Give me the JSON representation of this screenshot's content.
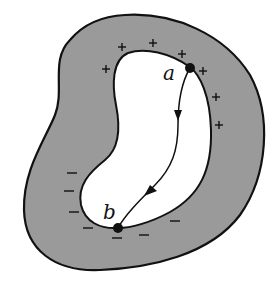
{
  "diagram": {
    "colors": {
      "conductor_fill": "#9a9a9a",
      "outline": "#111111",
      "cavity_fill": "#ffffff",
      "background": "#ffffff"
    },
    "points": {
      "a": {
        "label": "a",
        "x": 190,
        "y": 68
      },
      "b": {
        "label": "b",
        "x": 118,
        "y": 228
      }
    },
    "charges": {
      "positive_symbol": "+",
      "negative_symbol": "−",
      "positive": [
        {
          "x": 106,
          "y": 69
        },
        {
          "x": 122,
          "y": 47
        },
        {
          "x": 153,
          "y": 43
        },
        {
          "x": 182,
          "y": 54
        },
        {
          "x": 203,
          "y": 71
        },
        {
          "x": 216,
          "y": 97
        },
        {
          "x": 219,
          "y": 125
        }
      ],
      "negative": [
        {
          "x": 72,
          "y": 173
        },
        {
          "x": 69,
          "y": 191
        },
        {
          "x": 74,
          "y": 212
        },
        {
          "x": 88,
          "y": 228
        },
        {
          "x": 117,
          "y": 238
        },
        {
          "x": 144,
          "y": 235
        },
        {
          "x": 175,
          "y": 221
        }
      ]
    },
    "path": {
      "from": "a",
      "to": "b",
      "arrow_count": 2
    }
  }
}
